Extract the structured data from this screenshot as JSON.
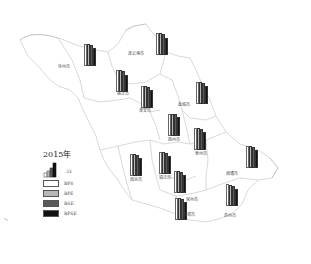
{
  "chart_data": {
    "type": "bar",
    "title": "2015年",
    "subtype": "choropleth-map-with-bar-glyphs",
    "region": "Jiangsu Province",
    "scale_reference": ".51",
    "series_names": [
      "BPS",
      "BPE",
      "BSE",
      "BPSE"
    ],
    "series_colors": [
      "#ffffff",
      "#b8b8b8",
      "#5a5a5a",
      "#111111"
    ],
    "categories": [
      "徐州市",
      "连云港市",
      "宿迁市",
      "淮安市",
      "盐城市",
      "扬州市",
      "泰州市",
      "南京市",
      "镇江市",
      "常州市",
      "无锡市",
      "苏州市",
      "南通市"
    ],
    "series": [
      {
        "name": "BPS",
        "values": [
          0.51,
          0.51,
          0.51,
          0.51,
          0.51,
          0.51,
          0.51,
          0.51,
          0.51,
          0.51,
          0.51,
          0.51,
          0.51
        ]
      },
      {
        "name": "BPE",
        "values": [
          0.51,
          0.5,
          0.5,
          0.5,
          0.51,
          0.5,
          0.5,
          0.51,
          0.5,
          0.5,
          0.5,
          0.49,
          0.5
        ]
      },
      {
        "name": "BSE",
        "values": [
          0.49,
          0.49,
          0.49,
          0.48,
          0.49,
          0.5,
          0.49,
          0.49,
          0.48,
          0.49,
          0.48,
          0.47,
          0.49
        ]
      },
      {
        "name": "BPSE",
        "values": [
          0.42,
          0.39,
          0.4,
          0.41,
          0.42,
          0.44,
          0.42,
          0.42,
          0.42,
          0.42,
          0.42,
          0.4,
          0.42
        ]
      }
    ],
    "note": "Values estimated from relative bar heights; reference bar in legend = .51"
  },
  "legend": {
    "title": "2015年",
    "scale_label": ".51",
    "items": [
      {
        "label": "BPS",
        "color": "#ffffff"
      },
      {
        "label": "BPE",
        "color": "#b8b8b8"
      },
      {
        "label": "BSE",
        "color": "#5a5a5a"
      },
      {
        "label": "BPSE",
        "color": "#111111"
      }
    ]
  },
  "cities": [
    {
      "name": "徐州市",
      "bars_x": 84,
      "bars_y": 44,
      "label_x": 58,
      "label_y": 63
    },
    {
      "name": "连云港市",
      "bars_x": 156,
      "bars_y": 33,
      "label_x": 128,
      "label_y": 50
    },
    {
      "name": "宿迁市",
      "bars_x": 116,
      "bars_y": 70,
      "label_x": 117,
      "label_y": 90
    },
    {
      "name": "淮安市",
      "bars_x": 141,
      "bars_y": 86,
      "label_x": 139,
      "label_y": 107
    },
    {
      "name": "盐城市",
      "bars_x": 196,
      "bars_y": 82,
      "label_x": 178,
      "label_y": 101
    },
    {
      "name": "扬州市",
      "bars_x": 168,
      "bars_y": 114,
      "label_x": 168,
      "label_y": 136
    },
    {
      "name": "泰州市",
      "bars_x": 194,
      "bars_y": 128,
      "label_x": 195,
      "label_y": 150
    },
    {
      "name": "南京市",
      "bars_x": 130,
      "bars_y": 154,
      "label_x": 130,
      "label_y": 176
    },
    {
      "name": "镇江市",
      "bars_x": 159,
      "bars_y": 152,
      "label_x": 159,
      "label_y": 174
    },
    {
      "name": "常州市",
      "bars_x": 174,
      "bars_y": 171,
      "label_x": 186,
      "label_y": 196
    },
    {
      "name": "无锡市",
      "bars_x": 175,
      "bars_y": 198,
      "label_x": 183,
      "label_y": 211
    },
    {
      "name": "苏州市",
      "bars_x": 226,
      "bars_y": 184,
      "label_x": 224,
      "label_y": 212
    },
    {
      "name": "南通市",
      "bars_x": 246,
      "bars_y": 146,
      "label_x": 226,
      "label_y": 170
    }
  ]
}
